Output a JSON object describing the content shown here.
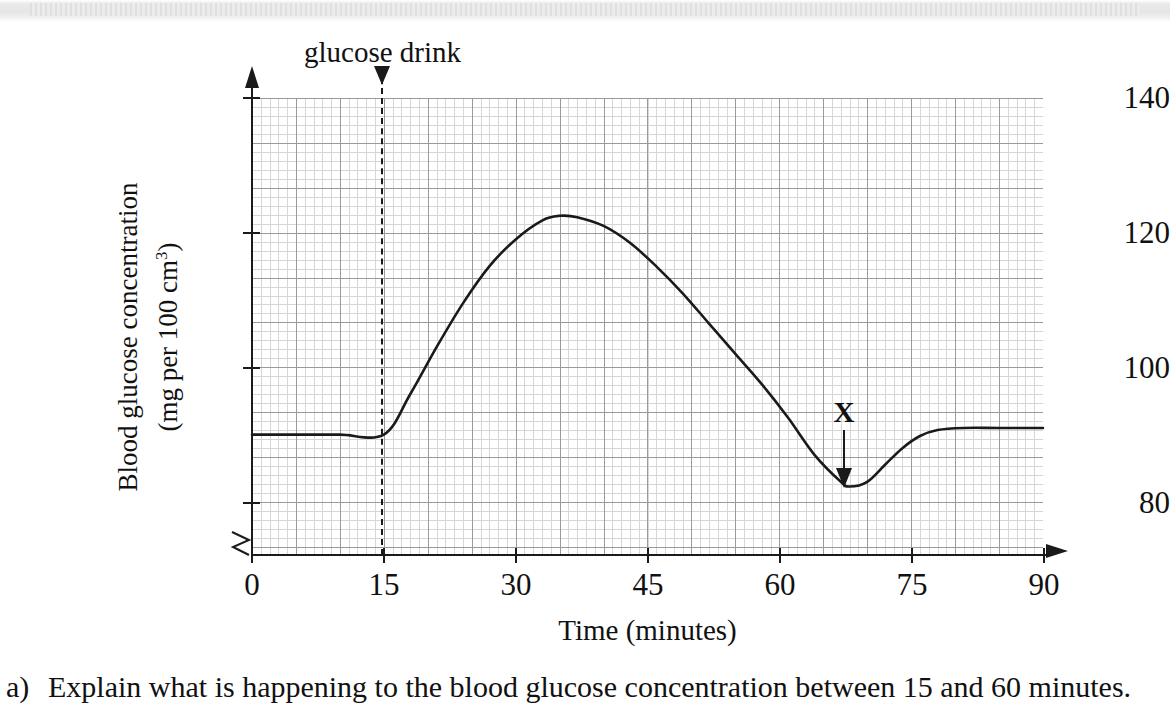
{
  "chart_data": {
    "type": "line",
    "title": "",
    "xlabel": "Time (minutes)",
    "ylabel": "Blood glucose concentration (mg per 100 cm3)",
    "ylabel_line1": "Blood glucose concentration",
    "ylabel_line2_pre": "(mg per 100 cm",
    "ylabel_line2_sup": "3",
    "ylabel_line2_post": ")",
    "xlim": [
      0,
      90
    ],
    "ylim": [
      75,
      140
    ],
    "y_axis_broken": true,
    "grid": "graph-paper minor 1.5 min / 1.5 mg, major 7.5 min / 10 mg",
    "legend": "none",
    "xticks": [
      0,
      15,
      30,
      45,
      60,
      75,
      90
    ],
    "xtick_labels": [
      "0",
      "15",
      "30",
      "45",
      "60",
      "75",
      "90"
    ],
    "yticks": [
      80,
      100,
      120,
      140
    ],
    "ytick_labels": [
      "80",
      "100",
      "120",
      "140"
    ],
    "series": [
      {
        "name": "blood glucose concentration",
        "x": [
          0,
          5,
          10,
          15,
          18,
          21,
          24,
          27,
          30,
          33,
          35,
          37,
          40,
          43,
          46,
          49,
          52,
          55,
          58,
          61,
          64,
          67,
          68,
          70,
          72,
          74,
          76,
          78,
          81,
          85,
          90
        ],
        "y": [
          90,
          90,
          90,
          90,
          96,
          103,
          109.5,
          115,
          119,
          121.8,
          122.5,
          122.3,
          121,
          118.5,
          115,
          111,
          106.5,
          102,
          97.5,
          92.5,
          87,
          83,
          82.3,
          83,
          85.5,
          88,
          89.8,
          90.7,
          91,
          91,
          91
        ]
      }
    ],
    "annotations": [
      {
        "name": "glucose-drink",
        "label": "glucose drink",
        "at_x": 15,
        "style": "dashed vertical line with down arrow"
      },
      {
        "name": "x-marker",
        "label": "X",
        "at_x": 67.5,
        "at_y": 82.3,
        "style": "down arrow pointing to curve minimum"
      }
    ],
    "baseline_value": 90,
    "peak": {
      "x": 35,
      "y": 122.5
    },
    "minimum": {
      "x": 67.5,
      "y": 82.3
    },
    "plateau_value": 91
  },
  "question": {
    "label": "a)",
    "text": "Explain what is happening to the blood glucose concentration between 15 and 60 minutes."
  }
}
